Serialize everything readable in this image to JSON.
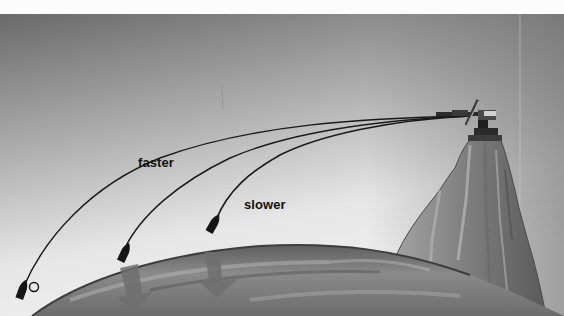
{
  "illustration": {
    "subject": "Newton's cannonball thought experiment",
    "labels": {
      "faster": "faster",
      "slower": "slower"
    },
    "landing_marker": "O",
    "elements": [
      "cannon-on-mountain",
      "mountain-peak",
      "earth-curve",
      "trajectory-faster",
      "trajectory-middle",
      "trajectory-slower",
      "cannonball-faster",
      "cannonball-middle",
      "cannonball-slower",
      "gravity-arrow-left",
      "gravity-arrow-right"
    ],
    "colors": {
      "sky_dark": "#6e6e6e",
      "sky_light": "#eeeeee",
      "earth": "#7a7a7a",
      "mountain": "#8c8c8c",
      "trajectory": "#1a1a1a",
      "arrow": "#6f6f6f",
      "label": "#111111"
    }
  }
}
